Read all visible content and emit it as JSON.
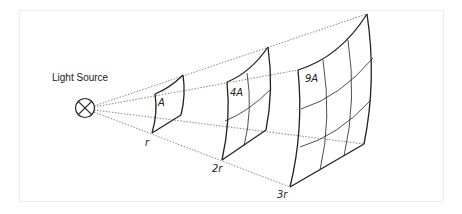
{
  "diagram": {
    "source_label": "Light Source",
    "surfaces": [
      {
        "area_label": "A",
        "distance_label": "r",
        "grid": 1
      },
      {
        "area_label": "4A",
        "distance_label": "2r",
        "grid": 2
      },
      {
        "area_label": "9A",
        "distance_label": "3r",
        "grid": 3
      }
    ],
    "colors": {
      "line": "#222222",
      "ray": "#555555",
      "frame": "#ececec"
    }
  }
}
